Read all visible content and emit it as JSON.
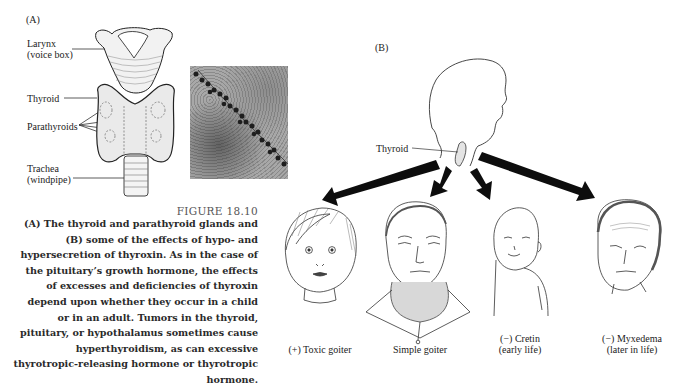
{
  "panel_a": {
    "label": "(A)",
    "labels": {
      "larynx_line1": "Larynx",
      "larynx_line2": "(voice box)",
      "thyroid": "Thyroid",
      "parathyroids": "Parathyroids",
      "trachea_line1": "Trachea",
      "trachea_line2": "(windpipe)"
    },
    "micrograph_alt": "electron-micrograph"
  },
  "figure": {
    "number": "FIGURE 18.10",
    "caption_lines": [
      "(A) The thyroid and parathyroid glands and",
      "(B) some of the effects of hypo- and",
      "hypersecretion of thyroxin. As in the case of",
      "the pituitary’s growth hormone, the effects",
      "of excesses and deficiencies of thyroxin",
      "depend upon whether they occur in a child",
      "or in an adult. Tumors in the thyroid,",
      "pituitary, or hypothalamus sometimes cause",
      "hyperthyroidism, as can excessive",
      "thyrotropic-releasing hormone or thyrotropic",
      "hormone."
    ]
  },
  "panel_b": {
    "label": "(B)",
    "thyroid_label": "Thyroid",
    "cases": [
      {
        "line1": "(+) Toxic goiter",
        "line2": ""
      },
      {
        "line1": "Simple goiter",
        "line2": ""
      },
      {
        "line1": "(−) Cretin",
        "line2": "(early life)"
      },
      {
        "line1": "(−) Myxedema",
        "line2": "(later in life)"
      }
    ]
  },
  "colors": {
    "ink": "#1a1a1a",
    "caption": "#2a2a2a",
    "figure_number": "#555555",
    "arrow": "#0d0d0d"
  }
}
